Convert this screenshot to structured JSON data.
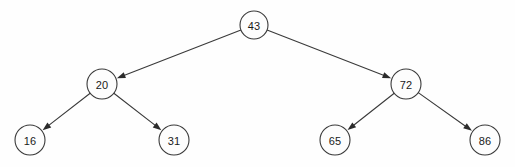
{
  "diagram": {
    "type": "binary-search-tree",
    "background_color": "#fefefe",
    "node_fill_color": "#fdfdfd",
    "node_stroke_color": "#3a3a3a",
    "edge_color": "#3a3a3a",
    "label_color": "#1a1a1a",
    "nodes": [
      {
        "id": "n43",
        "label": "43",
        "cx": 254,
        "cy": 25,
        "r": 14,
        "role": "root",
        "depth": 0
      },
      {
        "id": "n20",
        "label": "20",
        "cx": 102,
        "cy": 84,
        "r": 15,
        "role": "internal",
        "depth": 1
      },
      {
        "id": "n72",
        "label": "72",
        "cx": 406,
        "cy": 84,
        "r": 15,
        "role": "internal",
        "depth": 1
      },
      {
        "id": "n16",
        "label": "16",
        "cx": 30,
        "cy": 140,
        "r": 15,
        "role": "leaf",
        "depth": 2
      },
      {
        "id": "n31",
        "label": "31",
        "cx": 174,
        "cy": 140,
        "r": 15,
        "role": "leaf",
        "depth": 2
      },
      {
        "id": "n65",
        "label": "65",
        "cx": 335,
        "cy": 140,
        "r": 15,
        "role": "leaf",
        "depth": 2
      },
      {
        "id": "n86",
        "label": "86",
        "cx": 485,
        "cy": 140,
        "r": 15,
        "role": "leaf",
        "depth": 2
      }
    ],
    "edges": [
      {
        "id": "e43-20",
        "from": "n43",
        "to": "n20",
        "side": "left",
        "arrow": true
      },
      {
        "id": "e43-72",
        "from": "n43",
        "to": "n72",
        "side": "right",
        "arrow": true
      },
      {
        "id": "e20-16",
        "from": "n20",
        "to": "n16",
        "side": "left",
        "arrow": true
      },
      {
        "id": "e20-31",
        "from": "n20",
        "to": "n31",
        "side": "right",
        "arrow": true
      },
      {
        "id": "e72-65",
        "from": "n72",
        "to": "n65",
        "side": "left",
        "arrow": true
      },
      {
        "id": "e72-86",
        "from": "n72",
        "to": "n86",
        "side": "right",
        "arrow": true
      }
    ]
  }
}
